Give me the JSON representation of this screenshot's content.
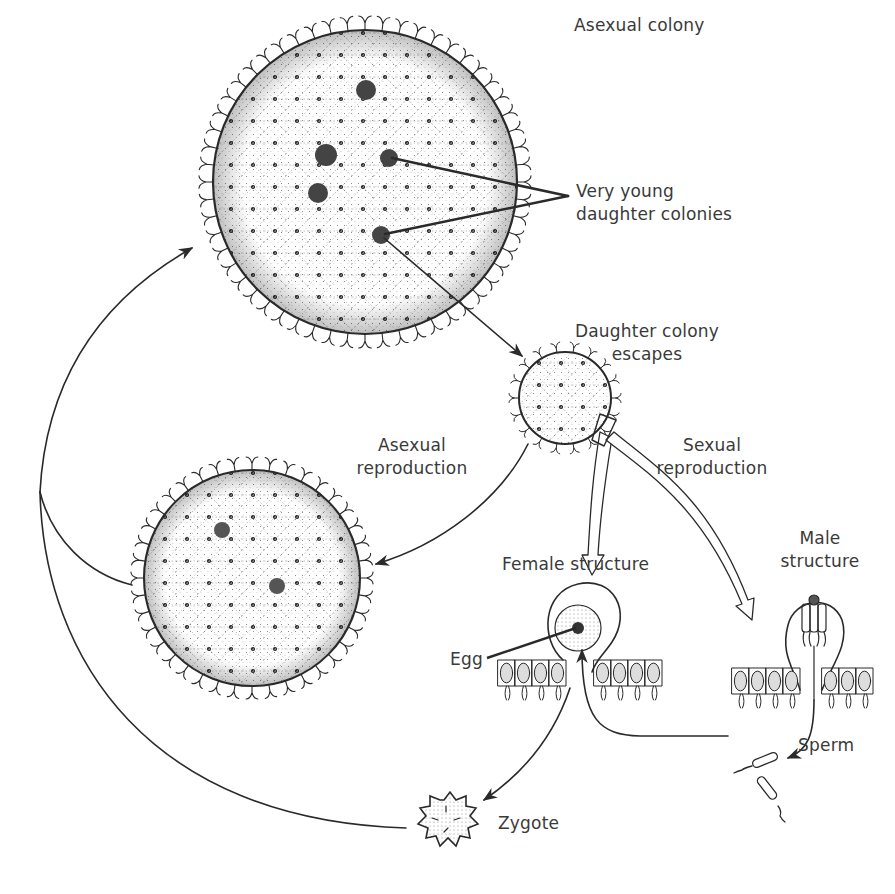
{
  "diagram": {
    "colors": {
      "ink": "#2a2a2a",
      "text": "#3a3a3a",
      "background": "#ffffff"
    },
    "labels": {
      "asexual_colony": "Asexual colony",
      "daughter_colonies_line1": "Very young",
      "daughter_colonies_line2": "daughter colonies",
      "escapes_line1": "Daughter colony",
      "escapes_line2": "escapes",
      "asexual_repro_line1": "Asexual",
      "asexual_repro_line2": "reproduction",
      "sexual_repro_line1": "Sexual",
      "sexual_repro_line2": "reproduction",
      "female_structure": "Female structure",
      "male_line1": "Male",
      "male_line2": "structure",
      "egg": "Egg",
      "sperm": "Sperm",
      "zygote": "Zygote"
    },
    "stages": [
      {
        "id": "asexual-colony",
        "label": "Asexual colony"
      },
      {
        "id": "daughter-colony",
        "label": "Daughter colony escapes"
      },
      {
        "id": "second-colony",
        "label": "Asexual reproduction"
      },
      {
        "id": "female-structure",
        "label": "Female structure"
      },
      {
        "id": "male-structure",
        "label": "Male structure"
      },
      {
        "id": "sperm",
        "label": "Sperm"
      },
      {
        "id": "zygote",
        "label": "Zygote"
      }
    ]
  }
}
